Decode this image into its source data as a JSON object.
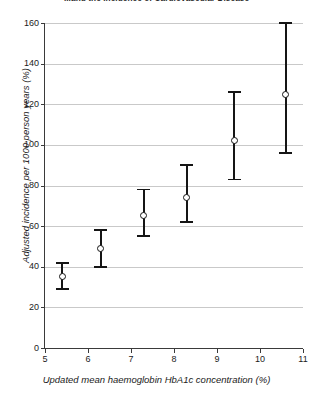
{
  "chart_data": {
    "type": "scatter",
    "title": "...and the Incidence of Cardiovascular Disease",
    "xlabel": "Updated mean haemoglobin HbA1c concentration (%)",
    "ylabel": "Adjusted incidence per 1000 person years (%)",
    "xlim": [
      5,
      11
    ],
    "ylim": [
      0,
      160
    ],
    "xticks": [
      5,
      6,
      7,
      8,
      9,
      10,
      11
    ],
    "yticks": [
      0,
      20,
      40,
      60,
      80,
      100,
      120,
      140,
      160
    ],
    "grid": "horizontal",
    "legend": "none",
    "marker_style": "open-circle",
    "error_style": "vertical-bar-with-caps",
    "points": [
      {
        "x": 5.4,
        "y": 35,
        "y_low": 29,
        "y_high": 42
      },
      {
        "x": 6.3,
        "y": 49,
        "y_low": 40,
        "y_high": 58
      },
      {
        "x": 7.3,
        "y": 65,
        "y_low": 55,
        "y_high": 78
      },
      {
        "x": 8.3,
        "y": 74,
        "y_low": 62,
        "y_high": 90
      },
      {
        "x": 9.4,
        "y": 102,
        "y_low": 83,
        "y_high": 126
      },
      {
        "x": 10.6,
        "y": 125,
        "y_low": 96,
        "y_high": 160
      }
    ]
  }
}
